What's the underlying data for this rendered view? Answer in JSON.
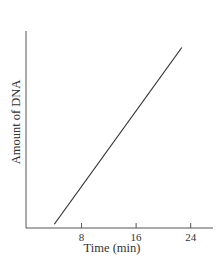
{
  "chart_data": {
    "type": "line",
    "title": "",
    "xlabel": "Time (min)",
    "ylabel": "Amount of DNA",
    "x_ticks": [
      8,
      16,
      24
    ],
    "y_ticks": [],
    "xlim": [
      0,
      27
    ],
    "ylim": [
      0,
      1
    ],
    "grid": false,
    "legend": null,
    "series": [
      {
        "name": "DNA amount",
        "x": [
          4,
          22.7
        ],
        "y": [
          0.02,
          0.96
        ]
      }
    ],
    "colors": {
      "line": "#333333",
      "axis": "#555555"
    }
  }
}
